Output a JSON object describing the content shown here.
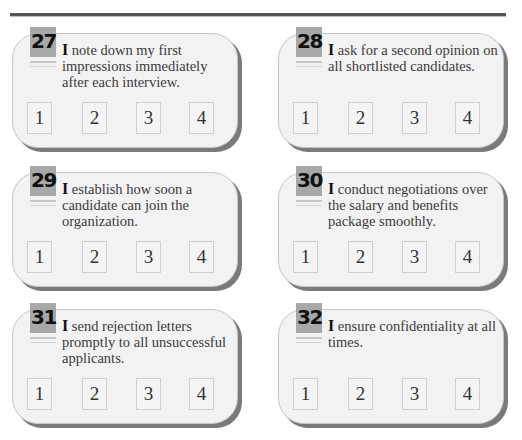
{
  "page": {
    "items": [
      {
        "number": "27",
        "lead": "I",
        "text": " note down my first impressions immediately after each interview.",
        "options": [
          "1",
          "2",
          "3",
          "4"
        ]
      },
      {
        "number": "28",
        "lead": "I",
        "text": " ask for a second opinion on all shortlisted candidates.",
        "options": [
          "1",
          "2",
          "3",
          "4"
        ]
      },
      {
        "number": "29",
        "lead": "I",
        "text": " establish how soon a candidate can join the organization.",
        "options": [
          "1",
          "2",
          "3",
          "4"
        ]
      },
      {
        "number": "30",
        "lead": "I",
        "text": " conduct negotiations over the salary and benefits package smoothly.",
        "options": [
          "1",
          "2",
          "3",
          "4"
        ]
      },
      {
        "number": "31",
        "lead": "I",
        "text": " send rejection letters promptly to all unsuccessful applicants.",
        "options": [
          "1",
          "2",
          "3",
          "4"
        ]
      },
      {
        "number": "32",
        "lead": "I",
        "text": " ensure confidentiality at all times.",
        "options": [
          "1",
          "2",
          "3",
          "4"
        ]
      }
    ]
  },
  "colors": {
    "card_bg": "#f2f2f2",
    "card_shadow": "#7a7a7a",
    "badge_bg": "#a8a8a8",
    "rule": "#555555"
  }
}
